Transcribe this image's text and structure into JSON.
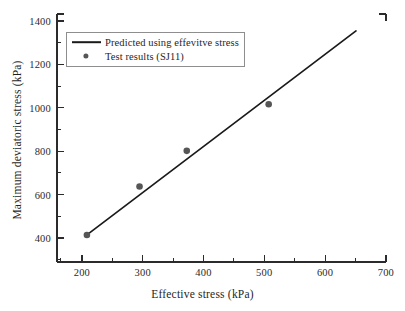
{
  "chart_data": {
    "type": "scatter",
    "title": "",
    "xlabel": "Effective stress (kPa)",
    "ylabel": "Maximum deviatoric stress (kPa)",
    "xlim": [
      150,
      700
    ],
    "ylim": [
      300,
      1400
    ],
    "grid": false,
    "legend_position": "upper-left",
    "xticks": [
      200,
      300,
      400,
      500,
      600,
      700
    ],
    "xtick_labels": [
      "200",
      "300",
      "400",
      "500",
      "600",
      "700"
    ],
    "yticks": [
      400,
      600,
      800,
      1000,
      1200,
      1400
    ],
    "ytick_labels": [
      "400",
      "600",
      "800",
      "1000",
      "1200",
      "1400"
    ],
    "x_minor_tick_interval": 50,
    "y_minor_tick_interval": 100,
    "series": [
      {
        "name": "Predicted using effevitve stress",
        "type": "line",
        "color": "#1a1a1a",
        "x": [
          200,
          650
        ],
        "y": [
          420,
          1325
        ]
      },
      {
        "name": "Test results (SJ11)",
        "type": "scatter",
        "color": "#565656",
        "marker": "circle",
        "x": [
          200,
          288,
          367,
          504
        ],
        "y": [
          420,
          635,
          793,
          1000
        ]
      }
    ],
    "annotations": []
  },
  "axes": {
    "x_tick_labels": [
      "200",
      "300",
      "400",
      "500",
      "600",
      "700"
    ],
    "y_tick_labels": [
      "400",
      "600",
      "800",
      "1000",
      "1200",
      "1400"
    ],
    "x_title": "Effective stress (kPa)",
    "y_title": "Maximum deviatoric stress (kPa)"
  },
  "legend": {
    "items": [
      {
        "label": "Predicted using effevitve stress",
        "marker": "line"
      },
      {
        "label": "Test results (SJ11)",
        "marker": "circle"
      }
    ]
  },
  "colors": {
    "line": "#1a1a1a",
    "marker": "#565656",
    "axis": "#2b2b2b",
    "background": "#ffffff"
  }
}
